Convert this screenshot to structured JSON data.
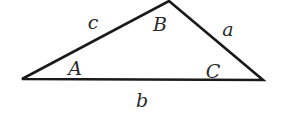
{
  "diagram": {
    "type": "triangle",
    "stroke_color": "#1a1a1a",
    "vertices": {
      "A": {
        "x": 22,
        "y": 79
      },
      "B": {
        "x": 169,
        "y": 1
      },
      "C": {
        "x": 263,
        "y": 80
      }
    },
    "angle_labels": {
      "A": {
        "text": "A",
        "x": 75,
        "y": 68
      },
      "B": {
        "text": "B",
        "x": 160,
        "y": 24
      },
      "C": {
        "text": "C",
        "x": 213,
        "y": 71
      }
    },
    "side_labels": {
      "a": {
        "text": "a",
        "x": 228,
        "y": 29
      },
      "b": {
        "text": "b",
        "x": 142,
        "y": 100
      },
      "c": {
        "text": "c",
        "x": 93,
        "y": 22
      }
    }
  }
}
